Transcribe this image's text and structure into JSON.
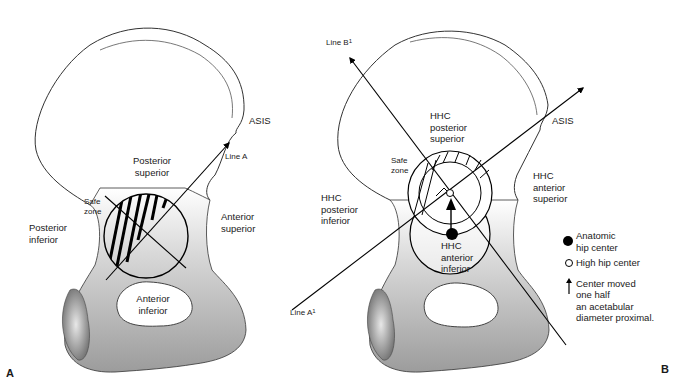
{
  "figure": {
    "panel_a": {
      "panel_label": "A",
      "labels": {
        "asis": "ASIS",
        "line": "Line A",
        "posterior_superior_1": "Posterior",
        "posterior_superior_2": "superior",
        "safe_zone_1": "Safe",
        "safe_zone_2": "zone",
        "posterior_inferior_1": "Posterior",
        "posterior_inferior_2": "inferior",
        "anterior_superior_1": "Anterior",
        "anterior_superior_2": "superior",
        "anterior_inferior_1": "Anterior",
        "anterior_inferior_2": "inferior"
      }
    },
    "panel_b": {
      "panel_label": "B",
      "labels": {
        "line_b": "Line B",
        "line_b_sup": "1",
        "line_a": "Line A",
        "line_a_sup": "1",
        "asis": "ASIS",
        "hhc_post_sup_1": "HHC",
        "hhc_post_sup_2": "posterior",
        "hhc_post_sup_3": "superior",
        "safe_zone_1": "Safe",
        "safe_zone_2": "zone",
        "hhc_post_inf_1": "HHC",
        "hhc_post_inf_2": "posterior",
        "hhc_post_inf_3": "inferior",
        "hhc_ant_sup_1": "HHC",
        "hhc_ant_sup_2": "anterior",
        "hhc_ant_sup_3": "superior",
        "hhc_ant_inf_1": "HHC",
        "hhc_ant_inf_2": "anterior",
        "hhc_ant_inf_3": "inferior"
      },
      "legend": [
        {
          "symbol": "filled-circle",
          "line1": "Anatomic",
          "line2": "hip center"
        },
        {
          "symbol": "open-circle",
          "line1": "High hip center"
        },
        {
          "symbol": "up-arrow",
          "line1": "Center moved",
          "line2": "one half",
          "line3": "an acetabular",
          "line4": "diameter proximal."
        }
      ]
    }
  }
}
